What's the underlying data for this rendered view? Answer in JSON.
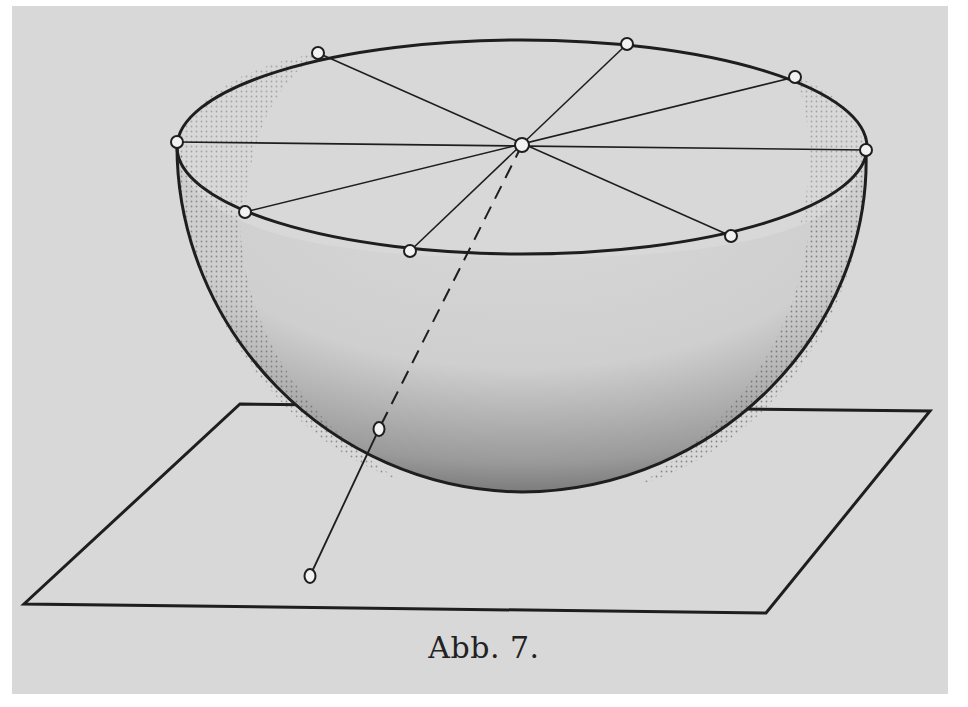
{
  "figure": {
    "caption": "Abb. 7.",
    "colors": {
      "paper": "#d8d8d8",
      "ink": "#1e1e1e",
      "shade": "#555555"
    },
    "center": {
      "x": 522,
      "y": 145
    },
    "rim_points": [
      {
        "x": 318,
        "y": 53
      },
      {
        "x": 627,
        "y": 44
      },
      {
        "x": 795,
        "y": 77
      },
      {
        "x": 866,
        "y": 150
      },
      {
        "x": 731,
        "y": 236
      },
      {
        "x": 410,
        "y": 251
      },
      {
        "x": 245,
        "y": 212
      },
      {
        "x": 177,
        "y": 142
      }
    ],
    "projection": {
      "upper_point": {
        "x": 379,
        "y": 429
      },
      "plane_point": {
        "x": 310,
        "y": 576
      }
    },
    "plane": {
      "corners": [
        {
          "x": 240,
          "y": 404
        },
        {
          "x": 930,
          "y": 411
        },
        {
          "x": 766,
          "y": 613
        },
        {
          "x": 24,
          "y": 604
        }
      ]
    }
  }
}
